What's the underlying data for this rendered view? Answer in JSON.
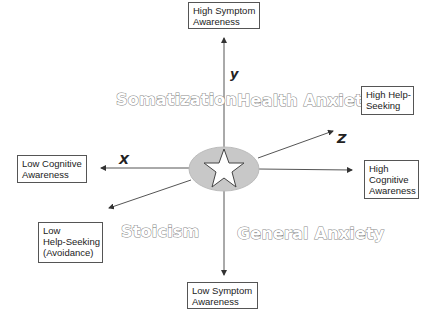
{
  "diagram": {
    "axes": {
      "x": "X",
      "y": "y",
      "z": "Z"
    },
    "endpoints": {
      "high_symptom": [
        "High Symptom",
        "Awareness"
      ],
      "low_symptom": [
        "Low Symptom",
        "Awareness"
      ],
      "high_help": [
        "High Help-",
        "Seeking"
      ],
      "low_help": [
        "Low",
        "Help-Seeking",
        "(Avoidance)"
      ],
      "high_cognitive": [
        "High",
        "Cognitive",
        "Awareness"
      ],
      "low_cognitive": [
        "Low Cognitive",
        "Awareness"
      ]
    },
    "quadrants": {
      "top_left": "Somatization",
      "top_right": "Health Anxiety",
      "bottom_left": "Stoicism",
      "bottom_right": "General Anxiety"
    },
    "center": {
      "icon": "star-icon",
      "fill": "#c8c8c8"
    },
    "colors": {
      "line": "#444444",
      "outline_text": "#888888",
      "ellipse": "#c8c8c8"
    }
  }
}
